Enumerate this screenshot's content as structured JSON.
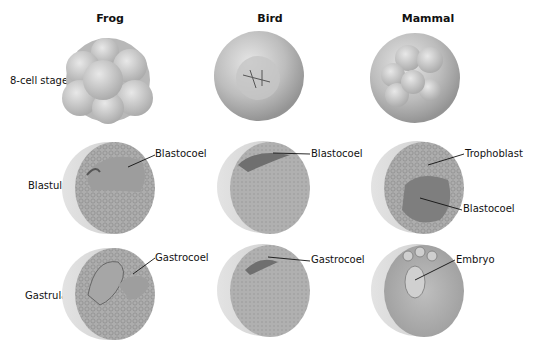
{
  "columns": [
    {
      "title": "Frog"
    },
    {
      "title": "Bird"
    },
    {
      "title": "Mammal"
    }
  ],
  "rows": [
    {
      "label": "8-cell stage"
    },
    {
      "label": "Blastula"
    },
    {
      "label": "Gastrula"
    }
  ],
  "callouts": {
    "frog_blastula": "Blastocoel",
    "bird_blastula": "Blastocoel",
    "mammal_blastula_top": "Trophoblast",
    "mammal_blastula_bottom": "Blastocoel",
    "frog_gastrula": "Gastrocoel",
    "bird_gastrula": "Gastrocoel",
    "mammal_gastrula": "Embryo"
  },
  "colors": {
    "background": "#ffffff",
    "sphere_light": "#d9d9d9",
    "sphere_mid": "#b3b3b3",
    "sphere_dark": "#8a8a8a",
    "cavity": "#7a7a7a",
    "text": "#111111"
  }
}
